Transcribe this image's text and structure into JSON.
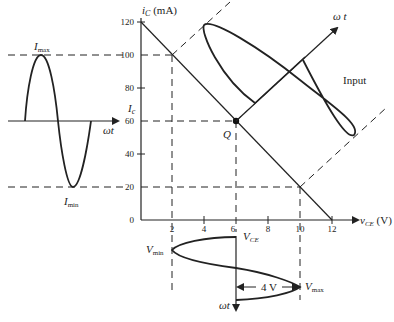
{
  "figure": {
    "y_axis_label": "i",
    "y_axis_sub": "C",
    "y_axis_unit": " (mA)",
    "x_axis_label": "v",
    "x_axis_sub": "CE",
    "x_axis_unit": " (V)",
    "y_ticks": [
      "0",
      "20",
      "40",
      "60",
      "80",
      "100",
      "120"
    ],
    "x_ticks": [
      "2",
      "4",
      "6",
      "8",
      "10",
      "12"
    ],
    "q_point_label": "Q",
    "ic_label": "I",
    "ic_sub": "c",
    "vce_label": "V",
    "vce_sub": "CE",
    "imax_label": "I",
    "imax_sub": "max",
    "imin_label": "I",
    "imin_sub": "min",
    "vmin_label": "V",
    "vmin_sub": "min",
    "vmax_label": "V",
    "vmax_sub": "max",
    "input_label": "Input",
    "omega_t_left": "ωt",
    "omega_t_diag": "ω t",
    "omega_t_bottom": "ωt",
    "amplitude_label": "4 V"
  },
  "colors": {
    "ink": "#222222",
    "background": "#ffffff"
  }
}
